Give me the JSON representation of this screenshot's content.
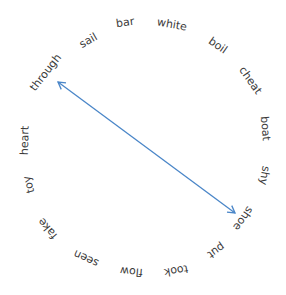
{
  "diagram": {
    "type": "circular-word-arrangement",
    "center": [
      146,
      148
    ],
    "words": [
      {
        "text": "bar",
        "x": 125,
        "y": 22,
        "rot": -8
      },
      {
        "text": "white",
        "x": 172,
        "y": 24,
        "rot": 10
      },
      {
        "text": "boil",
        "x": 218,
        "y": 45,
        "rot": 35
      },
      {
        "text": "cheat",
        "x": 250,
        "y": 80,
        "rot": 55
      },
      {
        "text": "boat",
        "x": 265,
        "y": 128,
        "rot": 85
      },
      {
        "text": "shy",
        "x": 264,
        "y": 175,
        "rot": 100
      },
      {
        "text": "shoe",
        "x": 243,
        "y": 218,
        "rot": 125
      },
      {
        "text": "put",
        "x": 216,
        "y": 250,
        "rot": 145
      },
      {
        "text": "took",
        "x": 176,
        "y": 270,
        "rot": 170
      },
      {
        "text": "flow",
        "x": 131,
        "y": 271,
        "rot": 185
      },
      {
        "text": "seen",
        "x": 86,
        "y": 258,
        "rot": 205
      },
      {
        "text": "fake",
        "x": 47,
        "y": 228,
        "rot": 230
      },
      {
        "text": "toy",
        "x": 29,
        "y": 184,
        "rot": 255
      },
      {
        "text": "heart",
        "x": 24,
        "y": 140,
        "rot": -88
      },
      {
        "text": "through",
        "x": 45,
        "y": 72,
        "rot": -52
      },
      {
        "text": "sail",
        "x": 88,
        "y": 40,
        "rot": -30
      }
    ],
    "arrow": {
      "from_word": "through",
      "to_word": "shoe",
      "x1": 58,
      "y1": 82,
      "x2": 235,
      "y2": 213,
      "double_headed": true,
      "color": "#4a86c8"
    }
  }
}
